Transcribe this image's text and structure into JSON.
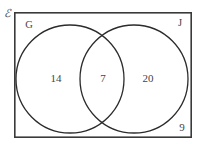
{
  "diagram": {
    "type": "venn-two-set",
    "universe": {
      "symbol": "ℰ",
      "name": "universal-set"
    },
    "sets": [
      {
        "id": "G",
        "label": "G",
        "name": "set-g"
      },
      {
        "id": "J",
        "label": "J",
        "name": "set-j"
      }
    ],
    "regions": [
      {
        "id": "g-only",
        "label": "14",
        "description": "G only"
      },
      {
        "id": "intersection",
        "label": "7",
        "description": "G and J"
      },
      {
        "id": "j-only",
        "label": "20",
        "description": "J only"
      },
      {
        "id": "outside",
        "label": "9",
        "description": "Neither G nor J"
      }
    ],
    "colors": {
      "rect_stroke": "#3a3a3a",
      "circle_stroke": "#2b2b2b",
      "text": "#444444",
      "background": "#ffffff"
    },
    "geometry": {
      "rect": {
        "x": 14,
        "y": 12,
        "width": 178,
        "height": 126
      },
      "circle_left": {
        "cx": 70,
        "cy": 79,
        "r": 54
      },
      "circle_right": {
        "cx": 134,
        "cy": 79,
        "r": 54
      }
    }
  }
}
